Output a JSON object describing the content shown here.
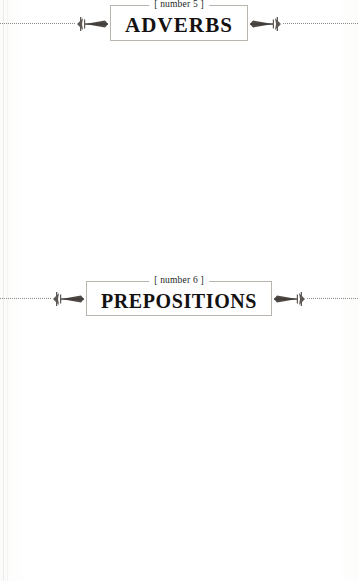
{
  "page": {
    "type": "grammar-reference-book-page",
    "sections": [
      {
        "number_label": "[ number 5 ]",
        "title": "ADVERBS",
        "rows": [
          {
            "label": "Overview",
            "text": "Other than distinguishing adverbs from adjectives, there are few problem areas relating to adverbs.",
            "example": null
          },
          {
            "label": "Definition",
            "text": "An adverb is a word that modifies a verb, an adjective, or another adverb.",
            "example": {
              "prefix": "Example: Sally is a nice person and you can speak ",
              "underlined": "freely",
              "suffix": " with her."
            }
          },
          {
            "label": "Grammar",
            "text": "Adverbs do not have gender, number, person, case, voice, mood, or tense.",
            "example": null
          }
        ]
      },
      {
        "number_label": "[ number 6 ]",
        "title": "PREPOSITIONS",
        "rows": [
          {
            "label": "Overview",
            "text": "There are few problem areas relating to the use of prepositions. However, as prepositions are used to form many idiomatic expressions, they can be confusing for students learning English as a foreign language.",
            "example": null
          },
          {
            "label": "Definition",
            "text": "A preposition is a word that shows a relationship between two or more words.",
            "example": {
              "prefix": "Example: Sally is a nice person and you can speak freely ",
              "underlined": "with",
              "suffix": " her."
            }
          },
          {
            "label": "Grammar",
            "text": "Prepositions do not have gender, number,",
            "example": null
          }
        ]
      }
    ]
  },
  "colors": {
    "paper": "#ffffff",
    "ink": "#1b1918",
    "rule": "#8e8a86",
    "box_border": "#b9b4ae"
  }
}
